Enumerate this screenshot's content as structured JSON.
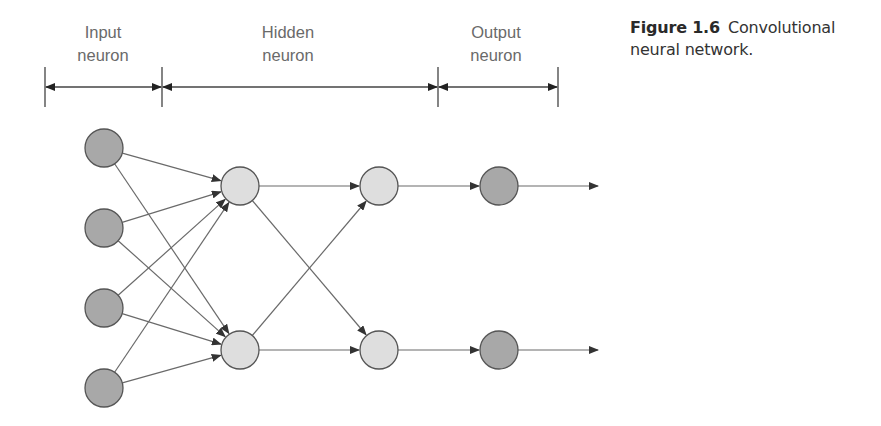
{
  "figure": {
    "number": "Figure 1.6",
    "caption_line1": "Convolutional",
    "caption_line2": "neural network."
  },
  "header": {
    "sections": [
      {
        "line1": "Input",
        "line2": "neuron",
        "x_start": 45,
        "x_end": 162,
        "label_x": 103
      },
      {
        "line1": "Hidden",
        "line2": "neuron",
        "x_start": 162,
        "x_end": 438,
        "label_x": 288
      },
      {
        "line1": "Output",
        "line2": "neuron",
        "x_start": 438,
        "x_end": 558,
        "label_x": 496
      }
    ]
  },
  "network": {
    "colors": {
      "input_fill": "#a8a8a8",
      "hidden_fill": "#dedede",
      "output_fill": "#a8a8a8",
      "stroke": "#555555",
      "edge": "#6a6a6a",
      "arrow": "#333333"
    },
    "radius": 19,
    "layers": [
      {
        "name": "input",
        "x": 104,
        "ys": [
          148,
          228,
          308,
          388
        ],
        "fill_key": "input_fill"
      },
      {
        "name": "hidden-1",
        "x": 240,
        "ys": [
          186,
          350
        ],
        "fill_key": "hidden_fill"
      },
      {
        "name": "hidden-2",
        "x": 379,
        "ys": [
          186,
          350
        ],
        "fill_key": "hidden_fill"
      },
      {
        "name": "output",
        "x": 499,
        "ys": [
          186,
          350
        ],
        "fill_key": "output_fill"
      }
    ],
    "output_arrow_end_x": 598
  }
}
